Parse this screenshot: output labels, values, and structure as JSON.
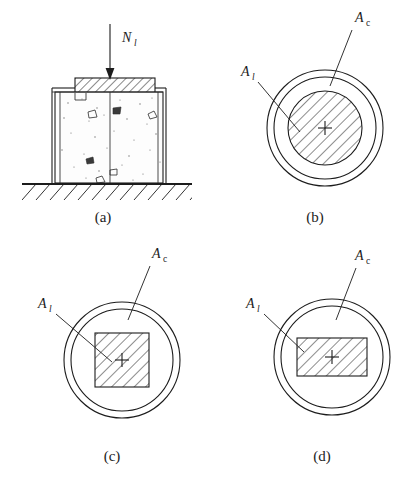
{
  "figure": {
    "background_color": "#ffffff",
    "line_color": "#1c1c1c"
  },
  "panels": [
    {
      "id": "a",
      "caption": "(a)",
      "caption_x": 103,
      "caption_y": 222,
      "type": "elevation-section",
      "description": "Concrete column elevation with bearing plate and ground hatching",
      "load_label": {
        "base": "N",
        "subscript": "l",
        "x": 126,
        "y": 40
      },
      "arrow": {
        "x": 110,
        "y_top": 24,
        "y_bottom": 78
      }
    },
    {
      "id": "b",
      "caption": "(b)",
      "caption_x": 315,
      "caption_y": 222,
      "type": "circular-bearing",
      "center": {
        "x": 325,
        "y": 128
      },
      "outer_radius": 58,
      "inner_radius": 51,
      "bearing_shape": "circle",
      "bearing_radius": 37,
      "labels": {
        "ac": {
          "base": "A",
          "subscript": "c",
          "x": 357,
          "y": 22
        },
        "al": {
          "base": "A",
          "subscript": "l",
          "x": 243,
          "y": 76
        }
      }
    },
    {
      "id": "c",
      "caption": "(c)",
      "caption_x": 112,
      "caption_y": 461,
      "type": "circular-bearing",
      "center": {
        "x": 122,
        "y": 360
      },
      "outer_radius": 58,
      "inner_radius": 51,
      "bearing_shape": "square",
      "bearing_width": 54,
      "bearing_height": 54,
      "labels": {
        "ac": {
          "base": "A",
          "subscript": "c",
          "x": 155,
          "y": 258
        },
        "al": {
          "base": "A",
          "subscript": "l",
          "x": 40,
          "y": 308
        }
      }
    },
    {
      "id": "d",
      "caption": "(d)",
      "caption_x": 322,
      "caption_y": 461,
      "type": "circular-bearing",
      "center": {
        "x": 332,
        "y": 357
      },
      "outer_radius": 58,
      "inner_radius": 51,
      "bearing_shape": "rectangle",
      "bearing_width": 70,
      "bearing_height": 38,
      "labels": {
        "ac": {
          "base": "A",
          "subscript": "c",
          "x": 357,
          "y": 260
        },
        "al": {
          "base": "A",
          "subscript": "l",
          "x": 248,
          "y": 308
        }
      }
    }
  ],
  "symbols": {
    "load": "N",
    "load_sub": "l",
    "area_concrete": "A",
    "area_concrete_sub": "c",
    "area_local": "A",
    "area_local_sub": "l",
    "center_mark": "+"
  }
}
